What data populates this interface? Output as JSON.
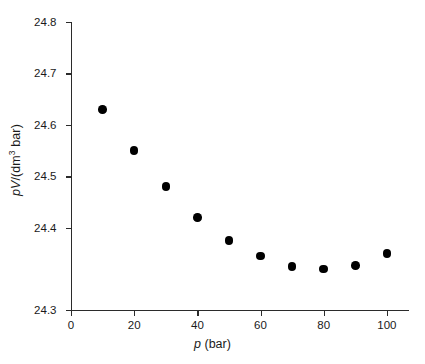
{
  "chart_data": {
    "type": "scatter",
    "title": "",
    "xlabel": "p (bar)",
    "ylabel": "pV/(dm3 bar)",
    "xlabel_parts": {
      "symbol": "p",
      "units": " (bar)"
    },
    "ylabel_parts": {
      "symbol": "pV",
      "units": "/(dm",
      "exponent": "3",
      "units_tail": " bar)"
    },
    "x": [
      10,
      20,
      30,
      40,
      50,
      60,
      70,
      80,
      90,
      100
    ],
    "values": [
      24.69,
      24.61,
      24.54,
      24.48,
      24.435,
      24.405,
      24.385,
      24.38,
      24.387,
      24.41
    ],
    "series": [
      {
        "name": "pV vs p",
        "points": [
          {
            "x": 10,
            "y": 24.69
          },
          {
            "x": 20,
            "y": 24.61
          },
          {
            "x": 30,
            "y": 24.54
          },
          {
            "x": 40,
            "y": 24.48
          },
          {
            "x": 50,
            "y": 24.435
          },
          {
            "x": 60,
            "y": 24.405
          },
          {
            "x": 70,
            "y": 24.385
          },
          {
            "x": 80,
            "y": 24.38
          },
          {
            "x": 90,
            "y": 24.387
          },
          {
            "x": 100,
            "y": 24.41
          }
        ]
      }
    ],
    "xlim": [
      0,
      107
    ],
    "ylim": [
      24.3,
      24.86
    ],
    "xticks": [
      0,
      20,
      40,
      60,
      80,
      100
    ],
    "xtick_labels": [
      "0",
      "20",
      "40",
      "60",
      "80",
      "100"
    ],
    "yticks": [
      24.3,
      24.4,
      24.5,
      24.6,
      24.7,
      24.8
    ],
    "ytick_labels": [
      "24.3",
      "24.4",
      "24.5",
      "24.6",
      "24.7",
      "24.8"
    ],
    "grid": false,
    "legend": null,
    "marker_color": "#000000",
    "axis_color": "#2b2b2b",
    "background_color": "#ffffff"
  }
}
